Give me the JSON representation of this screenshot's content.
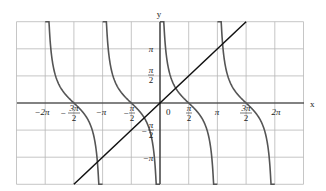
{
  "chart_data": {
    "type": "line",
    "title": "",
    "xlabel": "x",
    "ylabel": "y",
    "xlim": [
      -7.854,
      7.854
    ],
    "ylim": [
      -4.712,
      4.712
    ],
    "grid": true,
    "grid_step_x": "π/2",
    "grid_step_y": "π/2",
    "x_ticks": [
      {
        "value": -6.2832,
        "label": "−2π"
      },
      {
        "value": -4.7124,
        "label": "−3π/2"
      },
      {
        "value": -3.1416,
        "label": "−π"
      },
      {
        "value": -1.5708,
        "label": "−π/2"
      },
      {
        "value": 0,
        "label": "0"
      },
      {
        "value": 1.5708,
        "label": "π/2"
      },
      {
        "value": 3.1416,
        "label": "π"
      },
      {
        "value": 4.7124,
        "label": "3π/2"
      },
      {
        "value": 6.2832,
        "label": "2π"
      }
    ],
    "y_ticks": [
      {
        "value": 3.1416,
        "label": "π"
      },
      {
        "value": 1.5708,
        "label": "π/2"
      },
      {
        "value": -1.5708,
        "label": "−π/2"
      },
      {
        "value": -3.1416,
        "label": "−π"
      }
    ],
    "series": [
      {
        "name": "y = cot x",
        "color": "#555555",
        "function": "cot(x)",
        "branches": [
          [
            -6.2832,
            -3.1416
          ],
          [
            -3.1416,
            0
          ],
          [
            0,
            3.1416
          ],
          [
            3.1416,
            6.2832
          ]
        ]
      },
      {
        "name": "y = x",
        "color": "#111111",
        "function": "x",
        "x": [
          -4.7124,
          4.7124
        ],
        "y": [
          -4.7124,
          4.7124
        ]
      }
    ],
    "legend": "none"
  },
  "labels": {
    "x_axis": "x",
    "y_axis": "y",
    "origin": "0",
    "x_ticks": {
      "neg2pi": "−2π",
      "neg3pi2_num": "3π",
      "neg3pi2_den": "2",
      "negpi": "−π",
      "negpi2_num": "π",
      "negpi2_den": "2",
      "pi2_num": "π",
      "pi2_den": "2",
      "pi": "π",
      "pi3_2_num": "3π",
      "pi3_2_den": "2",
      "twopi": "2π"
    },
    "y_ticks": {
      "pi": "π",
      "pi2_num": "π",
      "pi2_den": "2",
      "negpi2_num": "π",
      "negpi2_den": "2",
      "negpi": "−π"
    },
    "minus": "−"
  }
}
